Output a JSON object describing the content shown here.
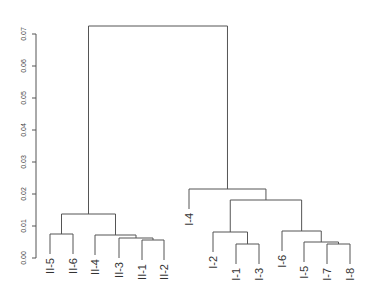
{
  "chart_data": {
    "type": "dendrogram",
    "title": "",
    "xlabel": "",
    "ylabel": "",
    "ylim": [
      0,
      0.075
    ],
    "y_ticks": [
      "0.00",
      "0.01",
      "0.02",
      "0.03",
      "0.04",
      "0.05",
      "0.06",
      "0.07"
    ],
    "grid": false,
    "leaves_order": [
      "II-5",
      "II-6",
      "II-4",
      "II-3",
      "II-1",
      "II-2",
      "I-4",
      "I-2",
      "I-1",
      "I-3",
      "I-6",
      "I-5",
      "I-7",
      "I-8"
    ],
    "merges": [
      {
        "children": [
          "II-1",
          "II-2"
        ],
        "height": 0.0056
      },
      {
        "children": [
          "II-3",
          "(II-1,II-2)"
        ],
        "height": 0.0063
      },
      {
        "children": [
          "II-4",
          "(II-3,II-1,II-2)"
        ],
        "height": 0.0072
      },
      {
        "children": [
          "II-5",
          "II-6"
        ],
        "height": 0.0075
      },
      {
        "children": [
          "(II-5,II-6)",
          "(II-4,II-3,II-1,II-2)"
        ],
        "height": 0.0138
      },
      {
        "children": [
          "I-1",
          "I-3"
        ],
        "height": 0.0044
      },
      {
        "children": [
          "I-2",
          "(I-1,I-3)"
        ],
        "height": 0.0081
      },
      {
        "children": [
          "I-7",
          "I-8"
        ],
        "height": 0.0044
      },
      {
        "children": [
          "I-5",
          "(I-7,I-8)"
        ],
        "height": 0.005
      },
      {
        "children": [
          "I-6",
          "(I-5,I-7,I-8)"
        ],
        "height": 0.0084
      },
      {
        "children": [
          "(I-2,I-1,I-3)",
          "(I-6,I-5,I-7,I-8)"
        ],
        "height": 0.018
      },
      {
        "children": [
          "I-4",
          "(I-2,I-1,I-3,I-6,I-5,I-7,I-8)"
        ],
        "height": 0.0216
      },
      {
        "children": [
          "II-group",
          "I-group"
        ],
        "height": 0.0725
      }
    ]
  },
  "layout": {
    "y_zero_px": 258,
    "px_per_unit": 3200,
    "axis_x": 36,
    "hang_px": 20,
    "leaf_x": {
      "II-5": 50,
      "II-6": 73,
      "II-4": 95,
      "II-3": 119,
      "II-1": 142,
      "II-2": 164,
      "I-4": 189,
      "I-2": 213,
      "I-1": 236,
      "I-3": 259,
      "I-6": 282,
      "I-5": 304,
      "I-7": 327,
      "I-8": 350
    },
    "branches": [
      {
        "id": "II12",
        "left": "II-1",
        "right": "II-2",
        "y": 240
      },
      {
        "id": "II3_12",
        "left": "II-3",
        "right": "II12",
        "y": 238
      },
      {
        "id": "II4_312",
        "left": "II-4",
        "right": "II3_12",
        "y": 235
      },
      {
        "id": "II56",
        "left": "II-5",
        "right": "II-6",
        "y": 234
      },
      {
        "id": "IIall",
        "left": "II56",
        "right": "II4_312",
        "y": 214
      },
      {
        "id": "I13",
        "left": "I-1",
        "right": "I-3",
        "y": 244
      },
      {
        "id": "I2_13",
        "left": "I-2",
        "right": "I13",
        "y": 232
      },
      {
        "id": "I78",
        "left": "I-7",
        "right": "I-8",
        "y": 244
      },
      {
        "id": "I5_78",
        "left": "I-5",
        "right": "I78",
        "y": 242
      },
      {
        "id": "I6_578",
        "left": "I-6",
        "right": "I5_78",
        "y": 231
      },
      {
        "id": "Isub",
        "left": "I2_13",
        "right": "I6_578",
        "y": 200
      },
      {
        "id": "Iall",
        "left": "I-4",
        "right": "Isub",
        "y": 189
      },
      {
        "id": "root",
        "left": "IIall",
        "right": "Iall",
        "y": 26
      }
    ]
  }
}
